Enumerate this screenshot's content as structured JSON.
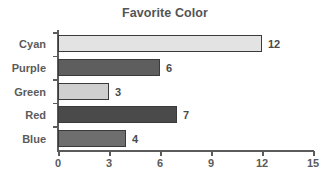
{
  "chart_data": {
    "type": "bar",
    "orientation": "horizontal",
    "title": "Favorite Color",
    "xlabel": "",
    "ylabel": "",
    "categories": [
      "Cyan",
      "Purple",
      "Green",
      "Red",
      "Blue"
    ],
    "values": [
      12,
      6,
      3,
      7,
      4
    ],
    "value_labels": [
      "12",
      "6",
      "3",
      "7",
      "4"
    ],
    "xlim": [
      0,
      15
    ],
    "xticks": [
      0,
      3,
      6,
      9,
      12,
      15
    ],
    "xtick_labels": [
      "0",
      "3",
      "6",
      "9",
      "12",
      "15"
    ],
    "grid": false,
    "legend": false,
    "bar_colors": [
      "#e3e3e3",
      "#5e5e5e",
      "#cfcfcf",
      "#4a4a4a",
      "#6e6e6e"
    ],
    "bar_edge_color": "#3a3a3a",
    "background_color": "#ffffff",
    "text_color": "#5b5b5b"
  }
}
